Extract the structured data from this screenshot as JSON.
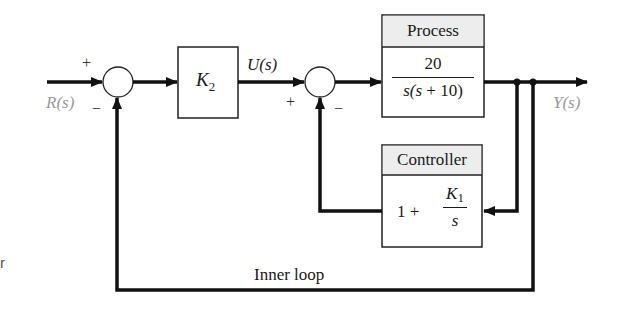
{
  "diagram": {
    "type": "block-diagram",
    "input": {
      "label": "R(s)",
      "sign_top": "+",
      "sign_bottom": "−"
    },
    "gain_block": {
      "symbol": "K",
      "subscript": "2"
    },
    "intermediate_signal": {
      "label": "U(s)"
    },
    "summer2": {
      "sign_left": "+",
      "sign_bottom": "−"
    },
    "process": {
      "title": "Process",
      "numerator": "20",
      "denominator_prefix": "s(s",
      "denominator_suffix": " + 10)"
    },
    "controller": {
      "title": "Controller",
      "lead": "1 + ",
      "numerator_symbol": "K",
      "numerator_subscript": "1",
      "denominator": "s"
    },
    "output": {
      "label": "Y(s)"
    },
    "loop_label": "Inner loop",
    "edge_fragment": "r"
  },
  "colors": {
    "line": "#111111",
    "box_header_bg": "#ededed",
    "signal_label": "#9a9a9a"
  }
}
